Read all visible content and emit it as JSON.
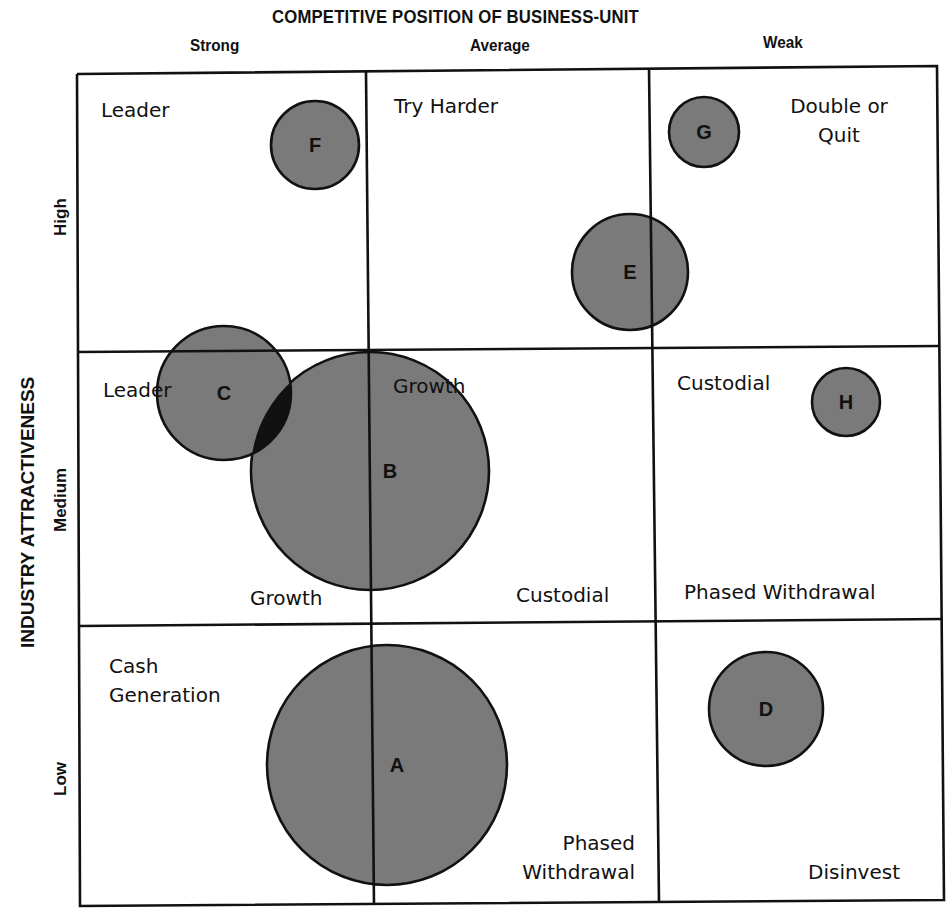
{
  "title": "COMPETITIVE POSITION OF BUSINESS-UNIT",
  "x_axis": {
    "label": "COMPETITIVE POSITION OF BUSINESS-UNIT",
    "categories": [
      "Strong",
      "Average",
      "Weak"
    ]
  },
  "y_axis": {
    "label": "INDUSTRY ATTRACTIVENESS",
    "categories": [
      "High",
      "Medium",
      "Low"
    ]
  },
  "colors": {
    "bubble_fill": "#7a7a7a",
    "bubble_overlap": "#111111",
    "line": "#111111",
    "background": "#ffffff"
  },
  "cells": {
    "high_strong": [
      "Leader"
    ],
    "high_average": [
      "Try Harder"
    ],
    "high_weak": [
      "Double or",
      "Quit"
    ],
    "medium_strong": [
      "Leader",
      "Growth"
    ],
    "medium_average": [
      "Growth",
      "Custodial"
    ],
    "medium_weak": [
      "Custodial",
      "Phased Withdrawal"
    ],
    "low_strong": [
      "Cash",
      "Generation"
    ],
    "low_average": [
      "Phased",
      "Withdrawal"
    ],
    "low_weak": [
      "Disinvest"
    ]
  },
  "labels": {
    "hs_leader": "Leader",
    "ha_try": "Try Harder",
    "hw_double": "Double or",
    "hw_quit": "Quit",
    "ms_leader": "Leader",
    "ms_growth": "Growth",
    "ma_growth": "Growth",
    "ma_custodial": "Custodial",
    "mw_custodial": "Custodial",
    "mw_phased": "Phased Withdrawal",
    "ls_cash": "Cash",
    "ls_generation": "Generation",
    "la_phased": "Phased",
    "la_withdrawal": "Withdrawal",
    "lw_disinvest": "Disinvest"
  },
  "chart_data": {
    "type": "bubble-matrix",
    "title": "COMPETITIVE POSITION OF BUSINESS-UNIT",
    "xlabel": "COMPETITIVE POSITION OF BUSINESS-UNIT",
    "ylabel": "INDUSTRY ATTRACTIVENESS",
    "x_categories": [
      "Strong",
      "Average",
      "Weak"
    ],
    "y_categories": [
      "High",
      "Medium",
      "Low"
    ],
    "grid": {
      "rows": 3,
      "cols": 3
    },
    "bubbles": [
      {
        "id": "A",
        "cx": 387,
        "cy": 765,
        "r": 120,
        "cell": "Low / Strong-Average boundary"
      },
      {
        "id": "B",
        "cx": 370,
        "cy": 471,
        "r": 119,
        "cell": "Medium / Strong-Average boundary"
      },
      {
        "id": "C",
        "cx": 224,
        "cy": 393,
        "r": 67,
        "cell": "Medium-High / Strong"
      },
      {
        "id": "D",
        "cx": 766,
        "cy": 709,
        "r": 57,
        "cell": "Low / Weak"
      },
      {
        "id": "E",
        "cx": 630,
        "cy": 272,
        "r": 58,
        "cell": "High / Average-Weak boundary"
      },
      {
        "id": "F",
        "cx": 315,
        "cy": 145,
        "r": 44,
        "cell": "High / Strong"
      },
      {
        "id": "G",
        "cx": 704,
        "cy": 132,
        "r": 35,
        "cell": "High / Weak"
      },
      {
        "id": "H",
        "cx": 846,
        "cy": 402,
        "r": 34,
        "cell": "Medium / Weak"
      }
    ],
    "strategy_labels": [
      "Leader",
      "Try Harder",
      "Double or Quit",
      "Leader",
      "Growth",
      "Growth",
      "Custodial",
      "Custodial",
      "Phased Withdrawal",
      "Cash Generation",
      "Phased Withdrawal",
      "Disinvest"
    ]
  }
}
